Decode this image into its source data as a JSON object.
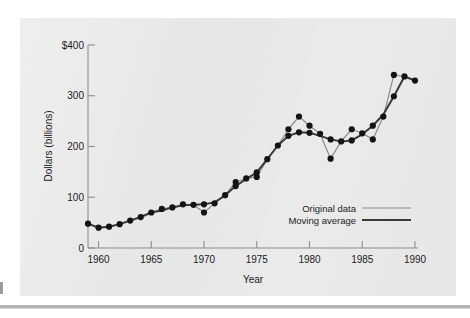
{
  "figure": {
    "background_color": "#e7e7e7",
    "page_color": "#ffffff"
  },
  "axes": {
    "x_title": "Year",
    "y_title": "Dollars (billions)",
    "x_ticks": [
      "1960",
      "1965",
      "1970",
      "1975",
      "1980",
      "1985",
      "1990"
    ],
    "y_ticks": [
      "$400",
      "300",
      "200",
      "100",
      "0"
    ]
  },
  "legend": {
    "items": [
      {
        "label": "Original data",
        "color": "#8c8c8c",
        "width": 1.2
      },
      {
        "label": "Moving average",
        "color": "#3a3a3a",
        "width": 2.2
      }
    ]
  },
  "chart_data": {
    "type": "line",
    "title": "",
    "subtitle": "",
    "xlabel": "Year",
    "ylabel": "Dollars (billions)",
    "xlim": [
      1959,
      1990
    ],
    "ylim": [
      0,
      400
    ],
    "x_ticks": [
      1960,
      1965,
      1970,
      1975,
      1980,
      1985,
      1990
    ],
    "x_tick_labels": [
      "1960",
      "1965",
      "1970",
      "1975",
      "1980",
      "1985",
      "1990"
    ],
    "y_ticks": [
      0,
      100,
      200,
      300,
      400
    ],
    "y_tick_labels": [
      "0",
      "100",
      "200",
      "300",
      "$400"
    ],
    "grid": false,
    "legend_position": "lower right",
    "markers": "filled-circle",
    "x": [
      1959,
      1960,
      1961,
      1962,
      1963,
      1964,
      1965,
      1966,
      1967,
      1968,
      1969,
      1970,
      1971,
      1972,
      1973,
      1974,
      1975,
      1976,
      1977,
      1978,
      1979,
      1980,
      1981,
      1982,
      1983,
      1984,
      1985,
      1986,
      1987,
      1988,
      1989,
      1990
    ],
    "series": [
      {
        "name": "Original data",
        "color": "#8c8c8c",
        "values": [
          48,
          40,
          42,
          47,
          54,
          61,
          70,
          77,
          80,
          86,
          85,
          70,
          88,
          104,
          130,
          137,
          140,
          175,
          202,
          234,
          259,
          241,
          225,
          176,
          210,
          234,
          226,
          214,
          259,
          341,
          338,
          330
        ]
      },
      {
        "name": "Moving average",
        "color": "#3a3a3a",
        "values": [
          48,
          40,
          42,
          47,
          54,
          61,
          70,
          74,
          80,
          84,
          85,
          86,
          90,
          104,
          122,
          136,
          149,
          175,
          202,
          221,
          228,
          227,
          221,
          214,
          210,
          212,
          224,
          241,
          263,
          299,
          338,
          330
        ]
      }
    ]
  }
}
